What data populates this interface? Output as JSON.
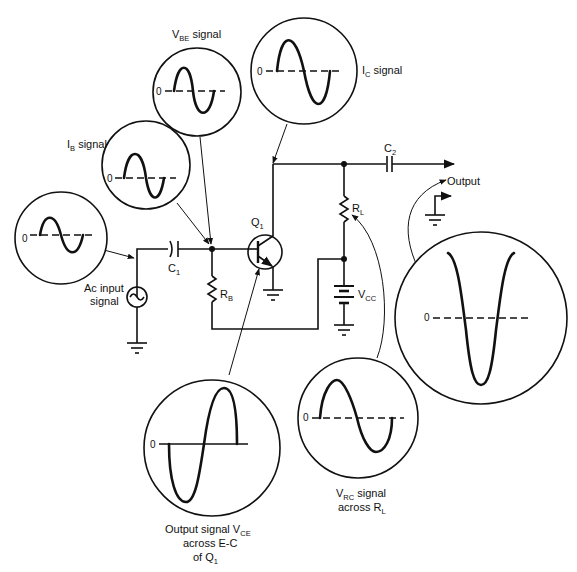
{
  "diagram": {
    "type": "common-emitter transistor amplifier with signal waveforms",
    "components": {
      "transistor": "Q",
      "transistor_sub": "1",
      "input_capacitor": "C",
      "input_capacitor_sub": "1",
      "output_capacitor": "C",
      "output_capacitor_sub": "2",
      "base_resistor": "R",
      "base_resistor_sub": "B",
      "load_resistor": "R",
      "load_resistor_sub": "L",
      "supply": "V",
      "supply_sub": "CC",
      "source_label_line1": "Ac input",
      "source_label_line2": "signal",
      "output_label": "Output"
    },
    "scopes": {
      "input": {
        "zero": "0"
      },
      "ib": {
        "title": "I",
        "title_sub": "B",
        "title_rest": " signal",
        "zero": "0"
      },
      "vbe": {
        "title": "V",
        "title_sub": "BE",
        "title_rest": " signal",
        "zero": "0"
      },
      "ic": {
        "title": "I",
        "title_sub": "C",
        "title_rest": " signal",
        "zero": "0"
      },
      "output": {
        "zero": "0"
      },
      "vce": {
        "line1": "Output signal V",
        "line1_sub": "CE",
        "line2": "across E-C",
        "line3": "of Q",
        "line3_sub": "1",
        "zero": "0"
      },
      "vrc": {
        "line1": "V",
        "line1_sub": "RC",
        "line1_rest": " signal",
        "line2": "across R",
        "line2_sub": "L",
        "zero": "0"
      }
    }
  }
}
